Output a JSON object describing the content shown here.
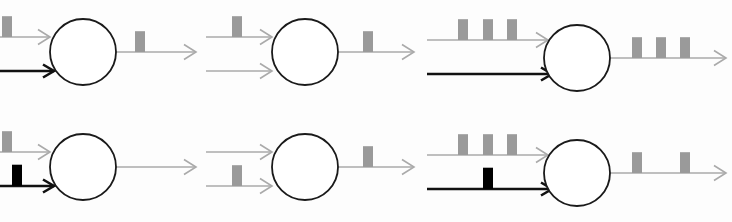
{
  "figure": {
    "width": 732,
    "height": 222,
    "background": "#fdfdfd",
    "type": "neuron-spike-train-diagram",
    "colors": {
      "inactive_line": "#aaaaaa",
      "inactive_spike": "#9a9a9a",
      "active_line": "#111111",
      "active_spike": "#000000",
      "soma_stroke": "#1a1a1a",
      "soma_fill": "#ffffff",
      "background": "#fdfdfd"
    },
    "geometry": {
      "soma_radius": 33,
      "spike_width": 10,
      "spike_height": 20,
      "line_width_inactive": 1.6,
      "line_width_active": 2.6,
      "soma_stroke_width": 1.8
    }
  },
  "panels": [
    {
      "id": "panel-1",
      "row": 0,
      "col": 0,
      "soma": {
        "cx": 83,
        "cy": 52,
        "r": 33
      },
      "inputs": [
        {
          "id": "panel-1-input-top",
          "role": "excitatory-input",
          "state": "inactive",
          "line": {
            "x1": -12,
            "y1": 37,
            "x2": 50,
            "y2": 37
          },
          "spikes": [
            2
          ],
          "spike_count": 1
        },
        {
          "id": "panel-1-input-bottom",
          "role": "modulatory-input",
          "state": "active",
          "line": {
            "x1": -6,
            "y1": 71,
            "x2": 54,
            "y2": 71
          },
          "spikes": [],
          "spike_count": 0
        }
      ],
      "output": {
        "id": "panel-1-output",
        "role": "axon-output",
        "state": "inactive",
        "line": {
          "x1": 114,
          "y1": 52,
          "x2": 196,
          "y2": 52
        },
        "spikes": [
          135
        ],
        "spike_count": 1
      }
    },
    {
      "id": "panel-2",
      "row": 0,
      "col": 1,
      "soma": {
        "cx": 305,
        "cy": 52,
        "r": 33
      },
      "inputs": [
        {
          "id": "panel-2-input-top",
          "role": "excitatory-input",
          "state": "inactive",
          "line": {
            "x1": 206,
            "y1": 37,
            "x2": 272,
            "y2": 37
          },
          "spikes": [
            232
          ],
          "spike_count": 1
        },
        {
          "id": "panel-2-input-bottom",
          "role": "modulatory-input",
          "state": "inactive",
          "line": {
            "x1": 206,
            "y1": 71,
            "x2": 272,
            "y2": 71
          },
          "spikes": [],
          "spike_count": 0
        }
      ],
      "output": {
        "id": "panel-2-output",
        "role": "axon-output",
        "state": "inactive",
        "line": {
          "x1": 336,
          "y1": 52,
          "x2": 414,
          "y2": 52
        },
        "spikes": [
          363
        ],
        "spike_count": 1
      }
    },
    {
      "id": "panel-3",
      "row": 0,
      "col": 2,
      "soma": {
        "cx": 577,
        "cy": 58,
        "r": 33
      },
      "inputs": [
        {
          "id": "panel-3-input-top",
          "role": "excitatory-input",
          "state": "inactive",
          "line": {
            "x1": 427,
            "y1": 40,
            "x2": 548,
            "y2": 40
          },
          "spikes": [
            458,
            483,
            507
          ],
          "spike_count": 3
        },
        {
          "id": "panel-3-input-bottom",
          "role": "modulatory-input",
          "state": "active",
          "line": {
            "x1": 427,
            "y1": 74,
            "x2": 552,
            "y2": 74
          },
          "spikes": [],
          "spike_count": 0
        }
      ],
      "output": {
        "id": "panel-3-output",
        "role": "axon-output",
        "state": "inactive",
        "line": {
          "x1": 608,
          "y1": 58,
          "x2": 726,
          "y2": 58
        },
        "spikes": [
          632,
          656,
          680
        ],
        "spike_count": 3
      }
    },
    {
      "id": "panel-4",
      "row": 1,
      "col": 0,
      "soma": {
        "cx": 83,
        "cy": 167,
        "r": 33
      },
      "inputs": [
        {
          "id": "panel-4-input-top",
          "role": "excitatory-input",
          "state": "inactive",
          "line": {
            "x1": -12,
            "y1": 152,
            "x2": 50,
            "y2": 152
          },
          "spikes": [
            2
          ],
          "spike_count": 1
        },
        {
          "id": "panel-4-input-bottom",
          "role": "modulatory-input",
          "state": "active",
          "line": {
            "x1": -6,
            "y1": 186,
            "x2": 54,
            "y2": 186
          },
          "spikes": [
            12
          ],
          "spike_count": 1
        }
      ],
      "output": {
        "id": "panel-4-output",
        "role": "axon-output",
        "state": "inactive",
        "line": {
          "x1": 114,
          "y1": 167,
          "x2": 196,
          "y2": 167
        },
        "spikes": [],
        "spike_count": 0
      }
    },
    {
      "id": "panel-5",
      "row": 1,
      "col": 1,
      "soma": {
        "cx": 305,
        "cy": 167,
        "r": 33
      },
      "inputs": [
        {
          "id": "panel-5-input-top",
          "role": "excitatory-input",
          "state": "inactive",
          "line": {
            "x1": 206,
            "y1": 152,
            "x2": 272,
            "y2": 152
          },
          "spikes": [],
          "spike_count": 0
        },
        {
          "id": "panel-5-input-bottom",
          "role": "modulatory-input",
          "state": "inactive",
          "line": {
            "x1": 206,
            "y1": 186,
            "x2": 272,
            "y2": 186
          },
          "spikes": [
            232
          ],
          "spike_count": 1
        }
      ],
      "output": {
        "id": "panel-5-output",
        "role": "axon-output",
        "state": "inactive",
        "line": {
          "x1": 336,
          "y1": 167,
          "x2": 414,
          "y2": 167
        },
        "spikes": [
          363
        ],
        "spike_count": 1
      }
    },
    {
      "id": "panel-6",
      "row": 1,
      "col": 2,
      "soma": {
        "cx": 577,
        "cy": 173,
        "r": 33
      },
      "inputs": [
        {
          "id": "panel-6-input-top",
          "role": "excitatory-input",
          "state": "inactive",
          "line": {
            "x1": 427,
            "y1": 155,
            "x2": 548,
            "y2": 155
          },
          "spikes": [
            458,
            483,
            507
          ],
          "spike_count": 3
        },
        {
          "id": "panel-6-input-bottom",
          "role": "modulatory-input",
          "state": "active",
          "line": {
            "x1": 427,
            "y1": 189,
            "x2": 552,
            "y2": 189
          },
          "spikes": [
            483
          ],
          "spike_count": 1
        }
      ],
      "output": {
        "id": "panel-6-output",
        "role": "axon-output",
        "state": "inactive",
        "line": {
          "x1": 608,
          "y1": 173,
          "x2": 726,
          "y2": 173
        },
        "spikes": [
          632,
          680
        ],
        "spike_count": 2
      }
    }
  ]
}
